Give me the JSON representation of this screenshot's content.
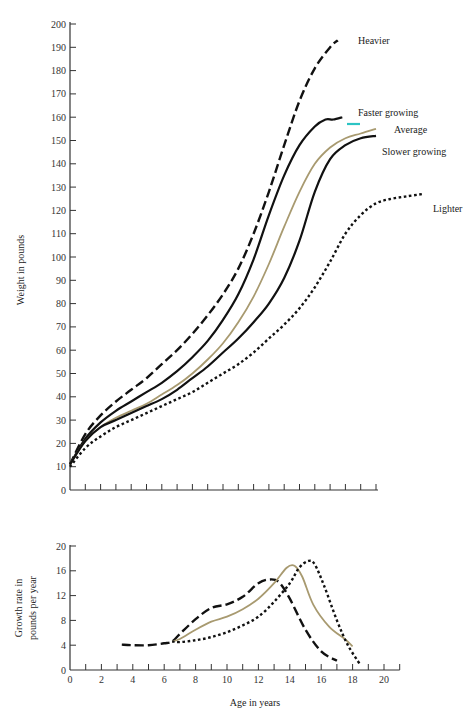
{
  "chart_data": [
    {
      "type": "line",
      "title": "",
      "xlabel": "",
      "ylabel": "Weight in pounds",
      "xlim": [
        0,
        20
      ],
      "ylim": [
        0,
        200
      ],
      "grid": false,
      "yticks": [
        0,
        10,
        20,
        30,
        40,
        50,
        60,
        70,
        80,
        90,
        100,
        110,
        120,
        130,
        140,
        150,
        160,
        170,
        180,
        190,
        200
      ],
      "xticks_count": 20,
      "series": [
        {
          "name": "Heavier",
          "style": "dashed",
          "color": "#111111",
          "x": [
            0,
            1,
            2,
            3,
            4,
            5,
            6,
            7,
            8,
            9,
            10,
            11,
            12,
            13,
            14,
            15,
            16,
            17,
            17.5
          ],
          "y": [
            11,
            24,
            32,
            38,
            43,
            48,
            54,
            60,
            67,
            75,
            84,
            95,
            110,
            128,
            148,
            167,
            181,
            190,
            193
          ]
        },
        {
          "name": "Faster growing",
          "style": "solid",
          "color": "#111111",
          "x": [
            0,
            1,
            2,
            3,
            4,
            5,
            6,
            7,
            8,
            9,
            10,
            11,
            12,
            13,
            14,
            15,
            16,
            16.7,
            17.2,
            17.8
          ],
          "y": [
            11,
            22,
            29,
            34,
            38,
            42,
            46,
            51,
            57,
            64,
            73,
            84,
            99,
            118,
            135,
            148,
            156,
            159,
            159,
            160
          ]
        },
        {
          "name": "Average",
          "style": "solid",
          "color": "#a89a70",
          "x": [
            0,
            1,
            2,
            3,
            4,
            5,
            6,
            7,
            8,
            9,
            10,
            11,
            12,
            13,
            14,
            15,
            16,
            17,
            18,
            19,
            20
          ],
          "y": [
            11,
            21,
            27,
            31,
            34,
            37,
            41,
            45,
            50,
            56,
            63,
            72,
            83,
            97,
            113,
            128,
            140,
            147,
            151,
            153,
            155
          ]
        },
        {
          "name": "Slower growing",
          "style": "solid",
          "color": "#111111",
          "x": [
            0,
            1,
            2,
            3,
            4,
            5,
            6,
            7,
            8,
            9,
            10,
            11,
            12,
            13,
            14,
            15,
            16,
            17,
            18,
            19,
            20
          ],
          "y": [
            11,
            21,
            27,
            30,
            33,
            36,
            39,
            43,
            48,
            53,
            59,
            65,
            72,
            80,
            91,
            107,
            128,
            142,
            148,
            151,
            152
          ]
        },
        {
          "name": "Lighter",
          "style": "dotted",
          "color": "#111111",
          "x": [
            0,
            1,
            2,
            3,
            4,
            5,
            6,
            7,
            8,
            9,
            10,
            11,
            12,
            13,
            14,
            15,
            16,
            17,
            18,
            19,
            20,
            21,
            22,
            23
          ],
          "y": [
            10,
            18,
            23,
            27,
            30,
            33,
            36,
            39,
            42,
            46,
            50,
            54,
            59,
            65,
            71,
            78,
            87,
            98,
            110,
            118,
            123,
            125,
            126,
            127
          ]
        }
      ]
    },
    {
      "type": "line",
      "title": "",
      "xlabel": "Age in years",
      "ylabel": "Growth rate in pounds per year",
      "xlim": [
        0,
        20
      ],
      "ylim": [
        0,
        20
      ],
      "grid": false,
      "xticks": [
        0,
        2,
        4,
        6,
        8,
        10,
        12,
        14,
        16,
        18,
        20
      ],
      "yticks": [
        0,
        4,
        8,
        12,
        16,
        20
      ],
      "series": [
        {
          "name": "Heavier",
          "style": "dashed",
          "color": "#111111",
          "x": [
            3.3,
            4,
            5,
            6,
            6.5,
            7,
            8,
            9,
            10,
            11,
            12,
            12.7,
            13.3,
            14,
            15,
            16,
            17
          ],
          "y": [
            4.1,
            4.0,
            4.0,
            4.3,
            4.6,
            5.8,
            8.2,
            10.0,
            10.6,
            11.8,
            14.0,
            14.6,
            14.2,
            11.5,
            6.5,
            3.0,
            1.5
          ]
        },
        {
          "name": "Average",
          "style": "solid",
          "color": "#a89a70",
          "x": [
            6.5,
            7,
            8,
            9,
            10,
            11,
            12,
            13,
            13.8,
            14.3,
            14.8,
            15.5,
            16.5,
            17.5,
            18
          ],
          "y": [
            4.6,
            5.0,
            6.5,
            7.8,
            8.6,
            9.8,
            11.5,
            14.0,
            16.5,
            16.8,
            15.0,
            10.5,
            7.0,
            5.0,
            3.8
          ]
        },
        {
          "name": "Lighter",
          "style": "dotted",
          "color": "#111111",
          "x": [
            6.5,
            7,
            8,
            9,
            10,
            11,
            12,
            13,
            14,
            14.6,
            15.2,
            15.6,
            16.2,
            17,
            17.7,
            18.5
          ],
          "y": [
            4.6,
            4.5,
            4.8,
            5.3,
            6.1,
            7.2,
            8.6,
            11.0,
            14.0,
            16.5,
            17.6,
            17.0,
            13.5,
            8.0,
            4.0,
            0.8
          ]
        }
      ]
    }
  ],
  "labels": {
    "heavier": "Heavier",
    "faster": "Faster growing",
    "average": "Average",
    "slower": "Slower growing",
    "lighter": "Lighter",
    "top_ylabel": "Weight in pounds",
    "bottom_ylabel_line1": "Growth rate in",
    "bottom_ylabel_line2": "pounds per year",
    "xlabel": "Age in years"
  }
}
